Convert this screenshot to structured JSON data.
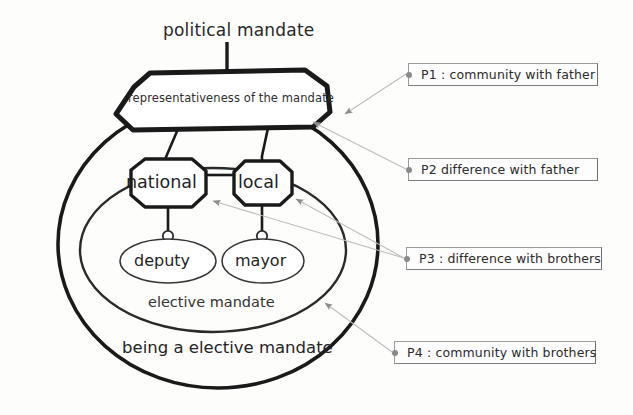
{
  "diagram": {
    "title": "political mandate",
    "root_node": "representativeness of the mandate",
    "nodes": [
      {
        "id": "national",
        "label": "national",
        "shape": "octagon"
      },
      {
        "id": "local",
        "label": "local",
        "shape": "octagon"
      }
    ],
    "leaves": [
      {
        "id": "deputy",
        "label": "deputy",
        "shape": "ellipse"
      },
      {
        "id": "mayor",
        "label": "mayor",
        "shape": "ellipse"
      }
    ],
    "inner_region_label": "elective mandate",
    "outer_region_label": "being a elective mandate"
  },
  "annotations": [
    {
      "id": "P1",
      "label": "P1 : community with father"
    },
    {
      "id": "P2",
      "label": "P2  difference with father"
    },
    {
      "id": "P3",
      "label": "P3 : difference with brothers"
    },
    {
      "id": "P4",
      "label": "P4 : community with brothers"
    }
  ],
  "colors": {
    "background": "#fdfdfc",
    "stroke_heavy": "#1a1a1a",
    "stroke_light": "#3a3a3a",
    "leader_line": "#b4b4b4",
    "arrowhead": "#8d8d8d",
    "box_border": "#9b9b9b",
    "text": "#2b2b2b"
  }
}
